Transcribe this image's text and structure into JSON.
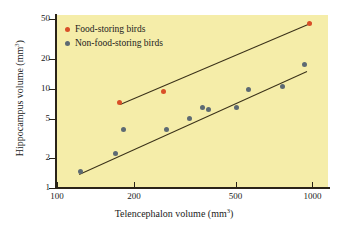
{
  "chart_data": {
    "type": "scatter",
    "title": "",
    "xlabel": "Telencephalon volume (mm3)",
    "xlabel_base": "Telencephalon volume (mm",
    "xlabel_sup": "3",
    "xlabel_tail": ")",
    "ylabel_base": "Hippocampus volume (mm",
    "ylabel_sup": "3",
    "ylabel_tail": ")",
    "xscale": "log",
    "yscale": "log",
    "xlim": [
      100,
      1150
    ],
    "ylim": [
      1,
      55
    ],
    "xticks": [
      100,
      200,
      500,
      1000
    ],
    "xtick_labels": [
      "100",
      "200",
      "500",
      "1000"
    ],
    "yticks": [
      1,
      2,
      5,
      10,
      20,
      50
    ],
    "ytick_labels": [
      "1",
      "2",
      "5",
      "10",
      "20",
      "50"
    ],
    "grid": false,
    "legend_position": "top-left",
    "background_color": "#f5eda9",
    "series": [
      {
        "name": "Food-storing birds",
        "color": "#d94f28",
        "marker": "circle",
        "points": [
          {
            "x": 176,
            "y": 7.2
          },
          {
            "x": 262,
            "y": 9.3
          },
          {
            "x": 975,
            "y": 45.0
          }
        ],
        "fit_line": {
          "x1": 176,
          "y1": 7.0,
          "x2": 985,
          "y2": 46.0
        }
      },
      {
        "name": "Non-food-storing birds",
        "color": "#5d6a73",
        "marker": "circle",
        "points": [
          {
            "x": 124,
            "y": 1.45
          },
          {
            "x": 170,
            "y": 2.2
          },
          {
            "x": 182,
            "y": 3.9
          },
          {
            "x": 268,
            "y": 3.85
          },
          {
            "x": 330,
            "y": 5.0
          },
          {
            "x": 372,
            "y": 6.5
          },
          {
            "x": 392,
            "y": 6.1
          },
          {
            "x": 505,
            "y": 6.4
          },
          {
            "x": 560,
            "y": 9.8
          },
          {
            "x": 760,
            "y": 10.5
          },
          {
            "x": 930,
            "y": 17.5
          }
        ],
        "fit_line": {
          "x1": 122,
          "y1": 1.38,
          "x2": 950,
          "y2": 15.0
        }
      }
    ]
  },
  "legend": {
    "items": [
      {
        "label": "Food-storing birds",
        "color": "#d94f28"
      },
      {
        "label": "Non-food-storing birds",
        "color": "#5d6a73"
      }
    ]
  }
}
